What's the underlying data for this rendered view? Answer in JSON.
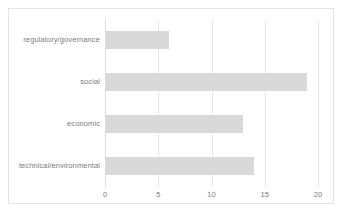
{
  "chart_data": {
    "type": "bar",
    "orientation": "horizontal",
    "title": "",
    "xlabel": "",
    "ylabel": "",
    "categories": [
      "regulatory/governance",
      "social",
      "economic",
      "technical/environmental"
    ],
    "values": [
      6,
      19,
      13,
      14
    ],
    "xlim": [
      0,
      20
    ],
    "xticks": [
      0,
      5,
      10,
      15,
      20
    ],
    "xtick_labels": [
      "0",
      "5",
      "10",
      "15",
      "20"
    ],
    "grid": true,
    "grid_axis": "x",
    "legend": null,
    "bar_color": "#d9d9d9",
    "gridline_color": "#e8e8e8",
    "text_color": "#7d7d7d",
    "frame_color": "#e3e3e3",
    "background_color": "#ffffff",
    "bars": [
      {
        "category": "regulatory/governance",
        "value": 6
      },
      {
        "category": "social",
        "value": 19
      },
      {
        "category": "economic",
        "value": 13
      },
      {
        "category": "technical/environmental",
        "value": 14
      }
    ]
  }
}
